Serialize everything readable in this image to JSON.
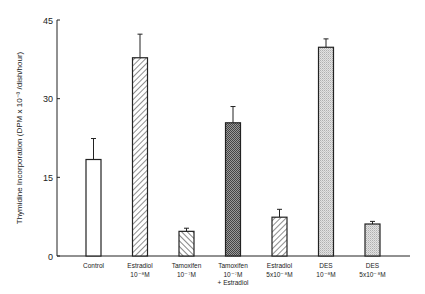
{
  "chart_data": {
    "type": "bar",
    "title": "",
    "xlabel": "",
    "ylabel": "Thymidine Incorporation (DPM x 10⁻³ /dish/hour)",
    "ylim": [
      0,
      45
    ],
    "yticks": [
      0,
      15,
      30,
      45
    ],
    "grid": false,
    "legend": "none",
    "categories": [
      [
        "Control"
      ],
      [
        "Estradiol",
        "10⁻⁸M"
      ],
      [
        "Tamoxifen",
        "10⁻⁷M"
      ],
      [
        "Tamoxifen",
        "10⁻⁷M",
        "+ Estradiol"
      ],
      [
        "Estradiol",
        "5x10⁻⁸M"
      ],
      [
        "DES",
        "10⁻⁸M"
      ],
      [
        "DES",
        "5x10⁻⁸M"
      ]
    ],
    "values": [
      18.4,
      37.8,
      4.7,
      25.4,
      7.4,
      39.8,
      6.1
    ],
    "error_upper": [
      22.4,
      42.3,
      5.3,
      28.5,
      8.9,
      41.4,
      6.6
    ],
    "patterns": [
      "none",
      "diag-forward",
      "diag-back",
      "dense-check",
      "diag-forward",
      "light-dots",
      "light-dots"
    ],
    "colors": {
      "axis": "#222222",
      "bar_stroke": "#222222",
      "hatch": "#444444",
      "dense": "#555555",
      "light": "#999999"
    }
  }
}
